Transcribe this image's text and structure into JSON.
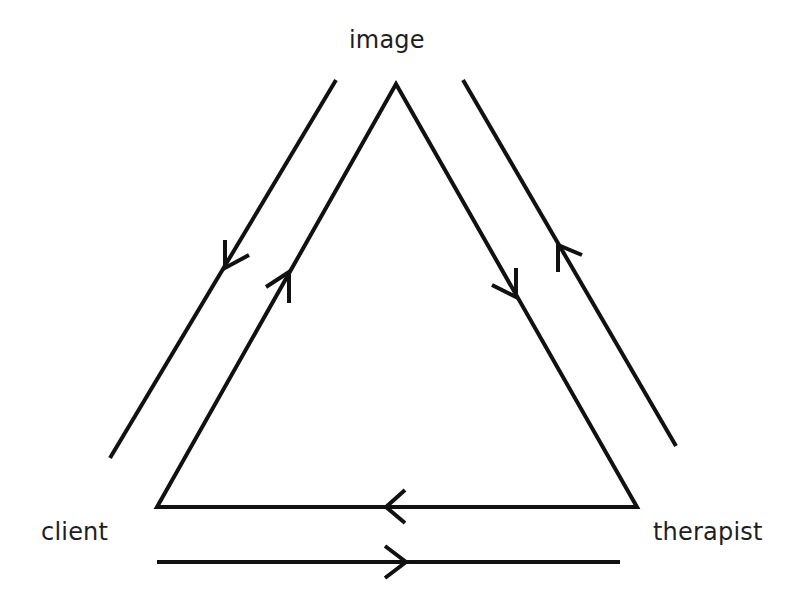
{
  "diagram": {
    "type": "triangular-relationship",
    "nodes": [
      {
        "id": "image",
        "label": "image"
      },
      {
        "id": "client",
        "label": "client"
      },
      {
        "id": "therapist",
        "label": "therapist"
      }
    ],
    "edges": [
      {
        "from": "client",
        "to": "image",
        "style": "triangle-side",
        "arrow": "toward image"
      },
      {
        "from": "image",
        "to": "therapist",
        "style": "triangle-side",
        "arrow": "toward therapist"
      },
      {
        "from": "therapist",
        "to": "client",
        "style": "triangle-base",
        "arrow": "toward client"
      },
      {
        "from": "image",
        "to": "client",
        "style": "outer-parallel",
        "arrow": "toward client"
      },
      {
        "from": "therapist",
        "to": "image",
        "style": "outer-parallel",
        "arrow": "toward image"
      },
      {
        "from": "client",
        "to": "therapist",
        "style": "outer-parallel",
        "arrow": "toward therapist"
      }
    ],
    "stroke_color": "#111111",
    "background": "#ffffff"
  }
}
